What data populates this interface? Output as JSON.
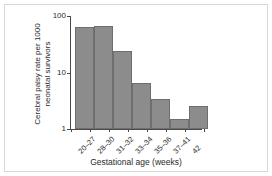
{
  "chart_data": {
    "type": "bar",
    "title": "",
    "subtitle": "",
    "xlabel": "Gestational age (weeks)",
    "ylabel": "Cerebral palsy rate per 1000 neonatal survivors",
    "categories": [
      "20–27",
      "28–30",
      "31–32",
      "33–34",
      "35–36",
      "37–41",
      "42"
    ],
    "values": [
      64,
      66,
      24,
      6.4,
      3.4,
      1.5,
      2.6
    ],
    "yscale": "log",
    "ylim": [
      1,
      100
    ],
    "yticks": [
      1,
      10,
      100
    ],
    "ytick_labels": [
      "1",
      "10",
      "100"
    ],
    "grid": false,
    "legend": null,
    "bar_color": "#8c8c8c",
    "bar_edge_color": "#6e6e6e",
    "axis_color": "#4a4a4a",
    "background_color": "#ffffff",
    "frame_color": "#d8d8d8"
  },
  "axes": {
    "y_title": "Cerebral palsy rate per 1000",
    "y_title_line2": "neonatal survivors",
    "x_title": "Gestational age (weeks)"
  }
}
